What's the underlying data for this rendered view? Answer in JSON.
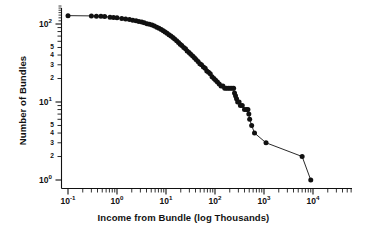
{
  "chart_data": {
    "type": "line",
    "title": "",
    "xlabel": "Income from Bundle (log Thousands)",
    "ylabel": "Number of Bundles",
    "xscale": "log",
    "yscale": "log",
    "xlim": [
      0.08,
      11000
    ],
    "ylim": [
      0.85,
      175
    ],
    "grid": false,
    "legend": null,
    "marker": "filled-circle",
    "line_color": "#111111",
    "marker_color": "#111111",
    "background_color": "#ffffff",
    "x_tick_labels": [
      "10-1",
      "100",
      "101",
      "102",
      "103",
      "104"
    ],
    "x_tick_values": [
      0.1,
      1,
      10,
      100,
      1000,
      10000
    ],
    "x_tick_mantissas": [
      "10",
      "10",
      "10",
      "10",
      "10",
      "10"
    ],
    "x_tick_exponents": [
      "-1",
      "0",
      "1",
      "2",
      "3",
      "4"
    ],
    "y_major_mantissas": [
      "10",
      "10",
      "10"
    ],
    "y_major_exponents": [
      "0",
      "1",
      "2"
    ],
    "y_major_values": [
      1,
      10,
      100
    ],
    "y_minor_labels": [
      "2",
      "3",
      "4",
      "5"
    ],
    "y_minor_values_low": [
      2,
      3,
      4,
      5
    ],
    "y_minor_values_high": [
      20,
      30,
      40,
      50
    ],
    "series": [
      {
        "name": "Bundles",
        "x": [
          0.1,
          0.3,
          0.38,
          0.47,
          0.56,
          0.72,
          0.85,
          1.0,
          1.25,
          1.5,
          1.8,
          2.1,
          2.45,
          2.8,
          3.2,
          3.6,
          4.1,
          4.6,
          5.2,
          5.8,
          6.5,
          7.2,
          8.0,
          8.8,
          9.6,
          10.5,
          11.5,
          12.6,
          13.8,
          15.0,
          16.5,
          18.0,
          19.5,
          21.0,
          23.0,
          25.0,
          27.0,
          29.5,
          32.0,
          35.0,
          38.0,
          41.0,
          45.0,
          49.0,
          53.0,
          58.0,
          63.0,
          68.0,
          74.0,
          80.0,
          87.0,
          95.0,
          103.0,
          112.0,
          122.0,
          133.0,
          145.0,
          158.0,
          172.0,
          187.0,
          203.0,
          221.0,
          240.0,
          250.0,
          262.0,
          275.0,
          290.0,
          310.0,
          330.0,
          360.0,
          400.0,
          440.0,
          470.0,
          490.0,
          510.0,
          560.0,
          640.0,
          1100.0,
          6000.0,
          9000.0
        ],
        "y": [
          128,
          127,
          126,
          126,
          125,
          122,
          121,
          120,
          118,
          116,
          114,
          112,
          110,
          108,
          106,
          104,
          101,
          99,
          97,
          94,
          91,
          88,
          85,
          82,
          79,
          76,
          73,
          70,
          67,
          64,
          61,
          58,
          55,
          53,
          50,
          48,
          45,
          43,
          41,
          39,
          37,
          35,
          33,
          31,
          30,
          28,
          27,
          25,
          24,
          23,
          21,
          20,
          19,
          18,
          17,
          16,
          16,
          15,
          15,
          15,
          15,
          15,
          15,
          13,
          12,
          11,
          10,
          10,
          9,
          9,
          8,
          8,
          8,
          7,
          6,
          5,
          4,
          3,
          2,
          1
        ]
      }
    ]
  }
}
